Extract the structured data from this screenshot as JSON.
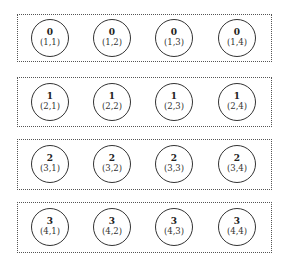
{
  "diagram": {
    "groups": [
      {
        "label": "group-row-1",
        "nodes": [
          {
            "rank": "0",
            "coord": "(1,1)"
          },
          {
            "rank": "0",
            "coord": "(1,2)"
          },
          {
            "rank": "0",
            "coord": "(1,3)"
          },
          {
            "rank": "0",
            "coord": "(1,4)"
          }
        ]
      },
      {
        "label": "group-row-2",
        "nodes": [
          {
            "rank": "1",
            "coord": "(2,1)"
          },
          {
            "rank": "1",
            "coord": "(2,2)"
          },
          {
            "rank": "1",
            "coord": "(2,3)"
          },
          {
            "rank": "1",
            "coord": "(2,4)"
          }
        ]
      },
      {
        "label": "group-row-3",
        "nodes": [
          {
            "rank": "2",
            "coord": "(3,1)"
          },
          {
            "rank": "2",
            "coord": "(3,2)"
          },
          {
            "rank": "2",
            "coord": "(3,3)"
          },
          {
            "rank": "2",
            "coord": "(3,4)"
          }
        ]
      },
      {
        "label": "group-row-4",
        "nodes": [
          {
            "rank": "3",
            "coord": "(4,1)"
          },
          {
            "rank": "3",
            "coord": "(4,2)"
          },
          {
            "rank": "3",
            "coord": "(4,3)"
          },
          {
            "rank": "3",
            "coord": "(4,4)"
          }
        ]
      }
    ],
    "colors": {
      "border": "#555555",
      "node_stroke": "#333333",
      "text": "#222222"
    }
  }
}
